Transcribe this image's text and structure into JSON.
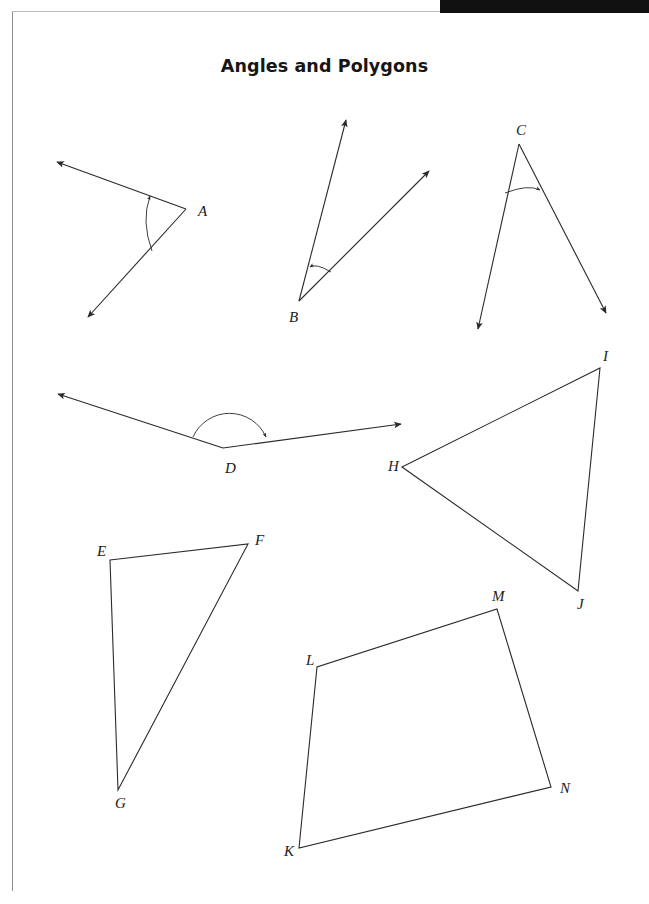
{
  "page": {
    "title": "Angles and Polygons",
    "background_color": "#ffffff",
    "ink_color": "#2a2a2a",
    "frame_color": "#8d8d8d",
    "header_band_color": "#111111"
  },
  "figures": {
    "angle_a": {
      "label": "A",
      "label_pos": [
        198,
        216
      ],
      "vertex": [
        186,
        209
      ],
      "ray1_end": [
        57,
        162
      ],
      "ray2_end": [
        88,
        317
      ],
      "arc_mark": "single-arc-arrow",
      "arrow_ends": [
        "ray1",
        "ray2"
      ]
    },
    "angle_b": {
      "label": "B",
      "label_pos": [
        289,
        322
      ],
      "vertex": [
        299,
        301
      ],
      "ray1_end": [
        346,
        120
      ],
      "ray2_end": [
        429,
        171
      ],
      "arc_mark": "single-arc-arrow",
      "arrow_ends": [
        "ray1",
        "ray2"
      ]
    },
    "angle_c": {
      "label": "C",
      "label_pos": [
        516,
        135
      ],
      "vertex": [
        519,
        144
      ],
      "ray1_end": [
        478,
        329
      ],
      "ray2_end": [
        606,
        313
      ],
      "arc_mark": "single-arc-arrow",
      "arrow_ends": [
        "ray1",
        "ray2"
      ]
    },
    "angle_d": {
      "label": "D",
      "label_pos": [
        225,
        473
      ],
      "vertex": [
        223,
        448
      ],
      "ray1_end": [
        58,
        394
      ],
      "ray2_end": [
        401,
        424
      ],
      "arc_mark": "semicircle-arc-arrow",
      "arrow_ends": [
        "ray1",
        "ray2"
      ]
    },
    "triangle_efg": {
      "labels": [
        "E",
        "F",
        "G"
      ],
      "vertices": [
        [
          110,
          560
        ],
        [
          248,
          544
        ],
        [
          118,
          790
        ]
      ],
      "label_positions": [
        [
          97,
          556
        ],
        [
          255,
          545
        ],
        [
          115,
          808
        ]
      ]
    },
    "triangle_hij": {
      "labels": [
        "H",
        "I",
        "J"
      ],
      "vertices": [
        [
          402,
          467
        ],
        [
          600,
          368
        ],
        [
          578,
          591
        ]
      ],
      "label_positions": [
        [
          388,
          471
        ],
        [
          603,
          361
        ],
        [
          577,
          609
        ]
      ]
    },
    "quadrilateral_klmn": {
      "labels": [
        "K",
        "L",
        "M",
        "N"
      ],
      "vertices": [
        [
          299,
          848
        ],
        [
          317,
          667
        ],
        [
          497,
          609
        ],
        [
          551,
          787
        ]
      ],
      "label_positions": [
        [
          284,
          856
        ],
        [
          306,
          665
        ],
        [
          492,
          601
        ],
        [
          560,
          793
        ]
      ]
    }
  }
}
